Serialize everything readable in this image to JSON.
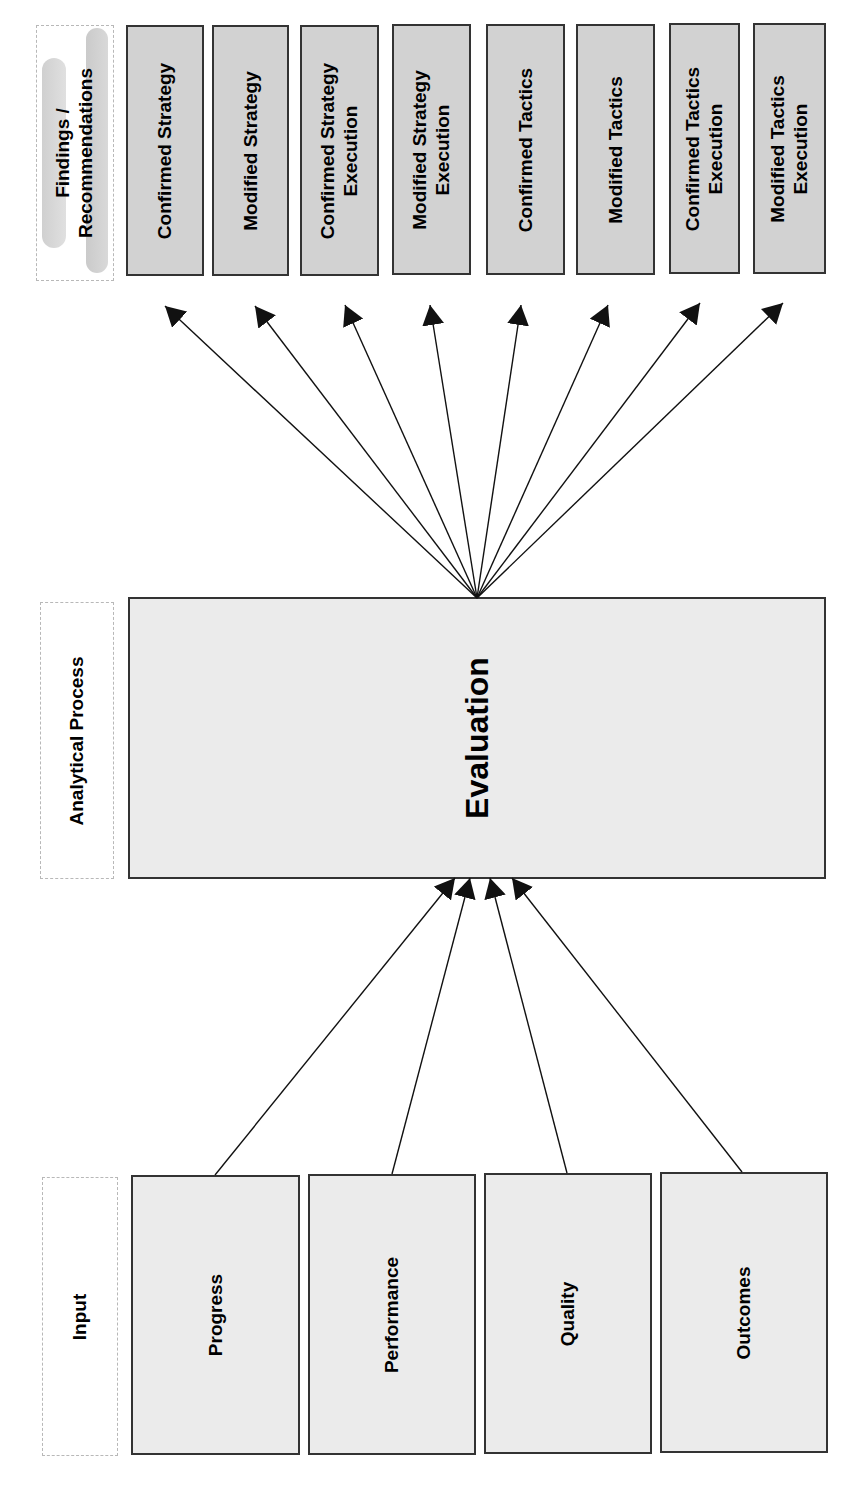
{
  "stages": {
    "findings": {
      "label_lines": [
        "Findings /",
        "Recommendations"
      ],
      "items": [
        {
          "lines": [
            "Confirmed Strategy"
          ]
        },
        {
          "lines": [
            "Modified Strategy"
          ]
        },
        {
          "lines": [
            "Confirmed Strategy",
            "Execution"
          ]
        },
        {
          "lines": [
            "Modified Strategy",
            "Execution"
          ]
        },
        {
          "lines": [
            "Confirmed Tactics"
          ]
        },
        {
          "lines": [
            "Modified Tactics"
          ]
        },
        {
          "lines": [
            "Confirmed Tactics",
            "Execution"
          ]
        },
        {
          "lines": [
            "Modified Tactics",
            "Execution"
          ]
        }
      ]
    },
    "analytical": {
      "label": "Analytical Process",
      "box": "Evaluation"
    },
    "input": {
      "label": "Input",
      "items": [
        "Progress",
        "Performance",
        "Quality",
        "Outcomes"
      ]
    }
  },
  "colors": {
    "findings_fill": "#d2d2d2",
    "process_fill": "#ebebeb",
    "border": "#333333",
    "arrow": "#111111"
  }
}
